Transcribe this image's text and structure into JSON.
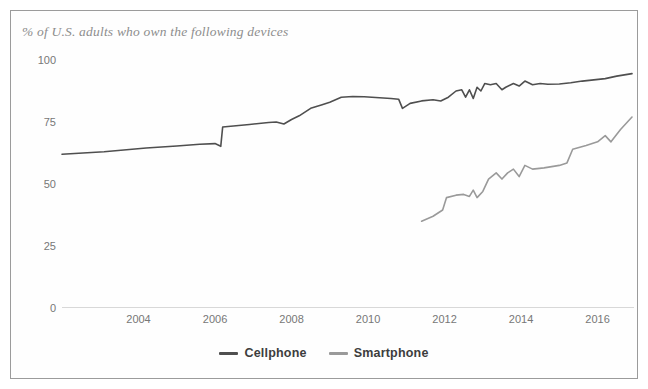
{
  "chart_data": {
    "type": "line",
    "title": "% of U.S. adults who own the following devices",
    "xlabel": "",
    "ylabel": "",
    "xlim": [
      2002.0,
      2016.9
    ],
    "ylim": [
      0,
      100
    ],
    "grid": false,
    "legend_position": "bottom-center",
    "x_ticks": [
      "2004",
      "2006",
      "2008",
      "2010",
      "2012",
      "2014",
      "2016"
    ],
    "x_tick_values": [
      2004,
      2006,
      2008,
      2010,
      2012,
      2014,
      2016
    ],
    "y_ticks": [
      "0",
      "25",
      "50",
      "75",
      "100"
    ],
    "y_tick_values": [
      0,
      25,
      50,
      75,
      100
    ],
    "series": [
      {
        "name": "Cellphone",
        "color": "#4f4f4f",
        "points": [
          [
            2002.0,
            62.0
          ],
          [
            2003.1,
            63.0
          ],
          [
            2004.2,
            64.5
          ],
          [
            2005.0,
            65.3
          ],
          [
            2005.6,
            66.0
          ],
          [
            2006.0,
            66.3
          ],
          [
            2006.15,
            65.2
          ],
          [
            2006.2,
            73.0
          ],
          [
            2006.9,
            74.0
          ],
          [
            2007.4,
            74.8
          ],
          [
            2007.6,
            75.0
          ],
          [
            2007.8,
            74.2
          ],
          [
            2008.0,
            76.0
          ],
          [
            2008.2,
            77.5
          ],
          [
            2008.5,
            80.5
          ],
          [
            2008.8,
            82.0
          ],
          [
            2009.0,
            83.0
          ],
          [
            2009.3,
            85.0
          ],
          [
            2009.6,
            85.3
          ],
          [
            2009.9,
            85.2
          ],
          [
            2010.3,
            84.8
          ],
          [
            2010.6,
            84.5
          ],
          [
            2010.8,
            84.2
          ],
          [
            2010.9,
            80.5
          ],
          [
            2011.1,
            82.5
          ],
          [
            2011.4,
            83.5
          ],
          [
            2011.7,
            84.0
          ],
          [
            2011.9,
            83.5
          ],
          [
            2012.1,
            85.0
          ],
          [
            2012.3,
            87.5
          ],
          [
            2012.45,
            88.0
          ],
          [
            2012.55,
            85.0
          ],
          [
            2012.65,
            88.0
          ],
          [
            2012.75,
            84.5
          ],
          [
            2012.85,
            89.0
          ],
          [
            2012.95,
            87.5
          ],
          [
            2013.05,
            90.5
          ],
          [
            2013.2,
            90.0
          ],
          [
            2013.35,
            90.5
          ],
          [
            2013.5,
            88.0
          ],
          [
            2013.6,
            89.0
          ],
          [
            2013.8,
            90.5
          ],
          [
            2013.95,
            89.5
          ],
          [
            2014.1,
            91.5
          ],
          [
            2014.3,
            90.0
          ],
          [
            2014.5,
            90.5
          ],
          [
            2014.7,
            90.2
          ],
          [
            2015.0,
            90.3
          ],
          [
            2015.3,
            90.8
          ],
          [
            2015.6,
            91.5
          ],
          [
            2015.9,
            92.0
          ],
          [
            2016.2,
            92.5
          ],
          [
            2016.5,
            93.5
          ],
          [
            2016.9,
            94.5
          ]
        ]
      },
      {
        "name": "Smartphone",
        "color": "#9a9a9a",
        "points": [
          [
            2011.4,
            35.0
          ],
          [
            2011.7,
            37.0
          ],
          [
            2011.95,
            39.5
          ],
          [
            2012.05,
            44.5
          ],
          [
            2012.3,
            45.5
          ],
          [
            2012.5,
            45.8
          ],
          [
            2012.65,
            45.0
          ],
          [
            2012.75,
            47.5
          ],
          [
            2012.85,
            44.5
          ],
          [
            2013.0,
            47.0
          ],
          [
            2013.15,
            52.0
          ],
          [
            2013.35,
            54.5
          ],
          [
            2013.5,
            52.0
          ],
          [
            2013.65,
            54.5
          ],
          [
            2013.8,
            56.0
          ],
          [
            2013.95,
            53.0
          ],
          [
            2014.1,
            57.5
          ],
          [
            2014.3,
            56.0
          ],
          [
            2014.6,
            56.5
          ],
          [
            2015.0,
            57.5
          ],
          [
            2015.2,
            58.5
          ],
          [
            2015.35,
            64.0
          ],
          [
            2015.7,
            65.5
          ],
          [
            2016.0,
            67.0
          ],
          [
            2016.2,
            69.5
          ],
          [
            2016.35,
            67.0
          ],
          [
            2016.6,
            72.0
          ],
          [
            2016.9,
            77.0
          ]
        ]
      }
    ]
  },
  "legend": {
    "entries": [
      {
        "label": "Cellphone"
      },
      {
        "label": "Smartphone"
      }
    ]
  },
  "colors": {
    "cellphone_line": "#4f4f4f",
    "smartphone_line": "#9a9a9a",
    "frame_border": "#9b9b9b",
    "tick_text": "#777777",
    "title_text": "#8d8d8d",
    "baseline": "#d8d8d8"
  }
}
